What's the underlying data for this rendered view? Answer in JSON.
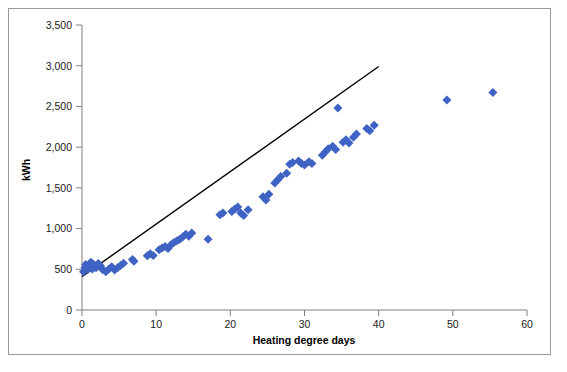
{
  "chart_data": {
    "type": "scatter",
    "title": "",
    "xlabel": "Heating degree days",
    "ylabel": "kWh",
    "xlim": [
      0,
      60
    ],
    "ylim": [
      0,
      3500
    ],
    "xticks": [
      0,
      10,
      20,
      30,
      40,
      50,
      60
    ],
    "xtick_labels": [
      "0",
      "10",
      "20",
      "30",
      "40",
      "50",
      "60"
    ],
    "yticks": [
      0,
      500,
      1000,
      1500,
      2000,
      2500,
      3000,
      3500
    ],
    "ytick_labels": [
      "0",
      "500",
      "1,000",
      "1,500",
      "2,000",
      "2,500",
      "3,000",
      "3,500"
    ],
    "grid": false,
    "legend": false,
    "marker": "diamond",
    "marker_color": "#3F63C4",
    "marker_size": 9,
    "series": [
      {
        "name": "Energy use vs heating degree days",
        "points": [
          [
            0.2,
            470
          ],
          [
            0.4,
            520
          ],
          [
            0.5,
            560
          ],
          [
            0.8,
            500
          ],
          [
            1.0,
            545
          ],
          [
            1.2,
            585
          ],
          [
            1.4,
            505
          ],
          [
            1.6,
            560
          ],
          [
            1.9,
            520
          ],
          [
            2.2,
            570
          ],
          [
            2.5,
            540
          ],
          [
            2.8,
            495
          ],
          [
            3.2,
            470
          ],
          [
            3.6,
            500
          ],
          [
            4.0,
            530
          ],
          [
            4.4,
            490
          ],
          [
            4.8,
            520
          ],
          [
            5.2,
            545
          ],
          [
            5.6,
            575
          ],
          [
            6.8,
            620
          ],
          [
            7.0,
            600
          ],
          [
            8.8,
            665
          ],
          [
            9.2,
            690
          ],
          [
            9.6,
            670
          ],
          [
            10.4,
            740
          ],
          [
            10.8,
            760
          ],
          [
            11.2,
            780
          ],
          [
            11.6,
            755
          ],
          [
            12.0,
            800
          ],
          [
            12.4,
            830
          ],
          [
            12.8,
            850
          ],
          [
            13.2,
            870
          ],
          [
            13.6,
            900
          ],
          [
            14.0,
            930
          ],
          [
            14.4,
            905
          ],
          [
            14.8,
            945
          ],
          [
            17.0,
            870
          ],
          [
            18.6,
            1170
          ],
          [
            19.0,
            1190
          ],
          [
            20.2,
            1210
          ],
          [
            20.6,
            1240
          ],
          [
            21.0,
            1265
          ],
          [
            21.4,
            1190
          ],
          [
            21.8,
            1160
          ],
          [
            22.4,
            1230
          ],
          [
            24.4,
            1390
          ],
          [
            24.8,
            1350
          ],
          [
            25.2,
            1420
          ],
          [
            26.0,
            1560
          ],
          [
            26.4,
            1600
          ],
          [
            26.8,
            1640
          ],
          [
            27.6,
            1680
          ],
          [
            28.0,
            1790
          ],
          [
            28.4,
            1810
          ],
          [
            29.2,
            1830
          ],
          [
            29.6,
            1800
          ],
          [
            30.0,
            1780
          ],
          [
            30.6,
            1820
          ],
          [
            31.0,
            1800
          ],
          [
            32.4,
            1900
          ],
          [
            32.8,
            1940
          ],
          [
            33.2,
            1980
          ],
          [
            33.8,
            2010
          ],
          [
            34.2,
            1970
          ],
          [
            34.5,
            2480
          ],
          [
            35.2,
            2060
          ],
          [
            35.6,
            2090
          ],
          [
            36.0,
            2050
          ],
          [
            36.6,
            2120
          ],
          [
            37.0,
            2160
          ],
          [
            38.4,
            2230
          ],
          [
            38.8,
            2200
          ],
          [
            39.4,
            2270
          ],
          [
            49.2,
            2580
          ],
          [
            55.4,
            2670
          ]
        ]
      }
    ],
    "trendline": {
      "type": "linear",
      "color": "#000000",
      "x_start": 0,
      "y_start": 410,
      "x_end": 40.0,
      "y_end": 2990
    }
  }
}
